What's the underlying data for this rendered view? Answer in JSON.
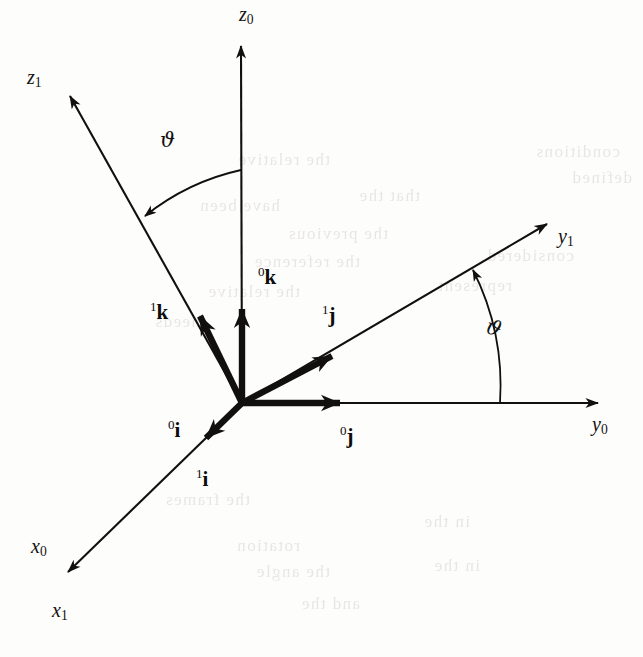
{
  "figure": {
    "background_color": "#fdfdfc",
    "ink_color": "#12100e",
    "width": 643,
    "height": 657
  },
  "axes": [
    {
      "id": "z0",
      "label": "z",
      "subscript": "0",
      "frame": "0",
      "name": "z-axis-frame0",
      "tip": [
        241,
        40
      ],
      "label_pos": [
        239,
        4
      ]
    },
    {
      "id": "z1",
      "label": "z",
      "subscript": "1",
      "frame": "1",
      "name": "z-axis-frame1",
      "tip": [
        64,
        90
      ],
      "label_pos": [
        27,
        67
      ]
    },
    {
      "id": "y0",
      "label": "y",
      "subscript": "0",
      "frame": "0",
      "name": "y-axis-frame0",
      "tip": [
        604,
        403
      ],
      "label_pos": [
        592,
        414
      ]
    },
    {
      "id": "y1",
      "label": "y",
      "subscript": "1",
      "frame": "1",
      "name": "y-axis-frame1",
      "tip": [
        553,
        218
      ],
      "label_pos": [
        558,
        226
      ]
    },
    {
      "id": "x0",
      "label": "x",
      "subscript": "0",
      "frame": "0",
      "name": "x-axis-frame0",
      "tip": [
        62,
        578
      ],
      "label_pos": [
        31,
        536
      ]
    },
    {
      "id": "x1",
      "label": "x",
      "subscript": "1",
      "frame": "1",
      "name": "x-axis-frame1",
      "tip": [
        62,
        578
      ],
      "label_pos": [
        52,
        600
      ]
    }
  ],
  "unit_vectors": [
    {
      "id": "0k",
      "frame": "0",
      "letter": "k",
      "name": "unit-vector-0k",
      "tip": [
        242,
        296
      ],
      "label_pos": [
        258,
        265
      ]
    },
    {
      "id": "1k",
      "frame": "1",
      "letter": "k",
      "name": "unit-vector-1k",
      "tip": [
        190,
        297
      ],
      "label_pos": [
        150,
        300
      ]
    },
    {
      "id": "0j",
      "frame": "0",
      "letter": "j",
      "name": "unit-vector-0j",
      "tip": [
        357,
        403
      ],
      "label_pos": [
        340,
        424
      ]
    },
    {
      "id": "1j",
      "frame": "1",
      "letter": "j",
      "name": "unit-vector-1j",
      "tip": [
        348,
        344
      ],
      "label_pos": [
        322,
        303
      ]
    },
    {
      "id": "0i",
      "frame": "0",
      "letter": "i",
      "name": "unit-vector-0i",
      "tip": [
        192,
        461
      ],
      "label_pos": [
        168,
        418
      ]
    },
    {
      "id": "1i",
      "frame": "1",
      "letter": "i",
      "name": "unit-vector-1i",
      "tip": [
        192,
        461
      ],
      "label_pos": [
        196,
        467
      ]
    }
  ],
  "angles": [
    {
      "id": "theta-z",
      "symbol": "ϑ",
      "name": "rotation-angle-theta-z",
      "from_axis": "z0",
      "to_axis": "z1",
      "label_pos": [
        160,
        130
      ]
    },
    {
      "id": "theta-y",
      "symbol": "ϑ",
      "name": "rotation-angle-theta-y",
      "from_axis": "y0",
      "to_axis": "y1",
      "label_pos": [
        486,
        318
      ]
    }
  ],
  "geometry": {
    "origin": [
      242,
      403
    ],
    "rotation_angle_deg": 30,
    "note": "frames 0 and 1 share the x axis; frame 1 is frame 0 rotated by the angle about x"
  },
  "ghost_text": {
    "note": "faint show-through text from the reverse side of the printed page",
    "lines": [
      {
        "text": "conditions",
        "x": 620,
        "y": 142
      },
      {
        "text": "the relative",
        "x": 330,
        "y": 150
      },
      {
        "text": "defined",
        "x": 632,
        "y": 168
      },
      {
        "text": "that the",
        "x": 420,
        "y": 186
      },
      {
        "text": "have been",
        "x": 280,
        "y": 196
      },
      {
        "text": "the previous",
        "x": 388,
        "y": 224
      },
      {
        "text": "considered",
        "x": 574,
        "y": 246
      },
      {
        "text": "the reference",
        "x": 360,
        "y": 252
      },
      {
        "text": "represent",
        "x": 512,
        "y": 276
      },
      {
        "text": "the relative",
        "x": 300,
        "y": 282
      },
      {
        "text": "needs",
        "x": 200,
        "y": 312
      },
      {
        "text": "the frames",
        "x": 250,
        "y": 490
      },
      {
        "text": "in the",
        "x": 470,
        "y": 512
      },
      {
        "text": "rotation",
        "x": 300,
        "y": 536
      },
      {
        "text": "in the",
        "x": 480,
        "y": 556
      },
      {
        "text": "the angle",
        "x": 330,
        "y": 562
      },
      {
        "text": "and the",
        "x": 360,
        "y": 594
      }
    ]
  }
}
